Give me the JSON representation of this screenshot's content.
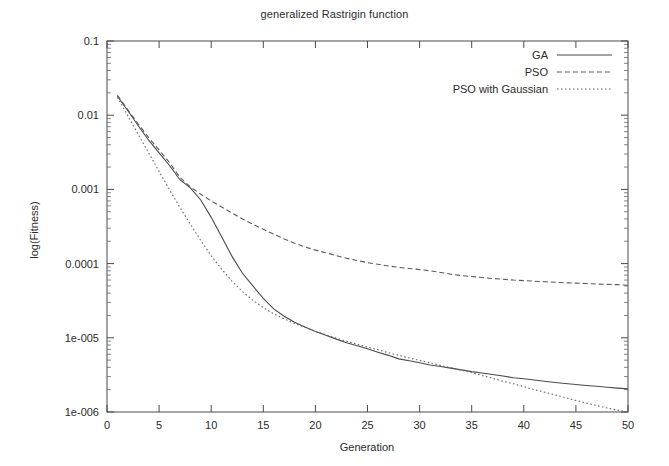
{
  "chart_data": {
    "type": "line",
    "title": "generalized Rastrigin function",
    "xlabel": "Generation",
    "ylabel": "log(Fitness)",
    "xlim": [
      0,
      50
    ],
    "ylim": [
      1e-06,
      0.1
    ],
    "yscale": "log",
    "grid": false,
    "legend_position": "top-right",
    "xticks": [
      0,
      5,
      10,
      15,
      20,
      25,
      30,
      35,
      40,
      45,
      50
    ],
    "xtick_labels": [
      "0",
      "5",
      "10",
      "15",
      "20",
      "25",
      "30",
      "35",
      "40",
      "45",
      "50"
    ],
    "yticks": [
      0.1,
      0.01,
      0.001,
      0.0001,
      1e-05,
      1e-06
    ],
    "ytick_labels": [
      "0.1",
      "0.01",
      "0.001",
      "0.0001",
      "1e-005",
      "1e-006"
    ],
    "x": [
      1,
      2,
      3,
      4,
      5,
      6,
      7,
      8,
      9,
      10,
      11,
      12,
      13,
      14,
      15,
      16,
      17,
      18,
      19,
      20,
      21,
      22,
      23,
      24,
      25,
      26,
      27,
      28,
      29,
      30,
      31,
      32,
      33,
      34,
      35,
      36,
      37,
      38,
      39,
      40,
      41,
      42,
      43,
      44,
      45,
      46,
      47,
      48,
      49,
      50
    ],
    "series": [
      {
        "name": "GA",
        "style": "solid",
        "values": [
          0.018,
          0.0115,
          0.0072,
          0.0046,
          0.0031,
          0.0021,
          0.00135,
          0.00105,
          0.00072,
          0.00042,
          0.00023,
          0.000125,
          7.4e-05,
          5e-05,
          3.4e-05,
          2.45e-05,
          1.95e-05,
          1.62e-05,
          1.4e-05,
          1.22e-05,
          1.08e-05,
          9.6e-06,
          8.6e-06,
          7.8e-06,
          7.1e-06,
          6.4e-06,
          5.8e-06,
          5.2e-06,
          4.9e-06,
          4.6e-06,
          4.3e-06,
          4.1e-06,
          3.9e-06,
          3.7e-06,
          3.5e-06,
          3.35e-06,
          3.2e-06,
          3.05e-06,
          2.9e-06,
          2.8e-06,
          2.7e-06,
          2.6e-06,
          2.5e-06,
          2.42e-06,
          2.35e-06,
          2.28e-06,
          2.22e-06,
          2.16e-06,
          2.1e-06,
          2.05e-06
        ]
      },
      {
        "name": "PSO",
        "style": "dashed",
        "values": [
          0.0185,
          0.0118,
          0.0076,
          0.005,
          0.0034,
          0.0023,
          0.00145,
          0.00108,
          0.00086,
          0.0007,
          0.00058,
          0.00048,
          0.0004,
          0.00034,
          0.00029,
          0.00025,
          0.000215,
          0.000188,
          0.000168,
          0.000152,
          0.00014,
          0.000128,
          0.000118,
          0.00011,
          0.000103,
          9.8e-05,
          9.3e-05,
          8.9e-05,
          8.6e-05,
          8.3e-05,
          8e-05,
          7.6e-05,
          7.2e-05,
          6.9e-05,
          6.7e-05,
          6.5e-05,
          6.3e-05,
          6.15e-05,
          6e-05,
          5.9e-05,
          5.8e-05,
          5.7e-05,
          5.6e-05,
          5.5e-05,
          5.45e-05,
          5.4e-05,
          5.3e-05,
          5.25e-05,
          5.2e-05,
          5.1e-05
        ]
      },
      {
        "name": "PSO with Gaussian",
        "style": "dotted",
        "values": [
          0.0175,
          0.0098,
          0.0055,
          0.0031,
          0.00175,
          0.00099,
          0.00057,
          0.00034,
          0.000205,
          0.000128,
          8.4e-05,
          5.8e-05,
          4.2e-05,
          3.2e-05,
          2.55e-05,
          2.1e-05,
          1.8e-05,
          1.56e-05,
          1.38e-05,
          1.23e-05,
          1.1e-05,
          9.9e-06,
          9e-06,
          8.2e-06,
          7.5e-06,
          6.9e-06,
          6.3e-06,
          5.8e-06,
          5.35e-06,
          4.95e-06,
          4.6e-06,
          4.25e-06,
          3.95e-06,
          3.65e-06,
          3.4e-06,
          3.1e-06,
          2.85e-06,
          2.6e-06,
          2.4e-06,
          2.2e-06,
          2e-06,
          1.85e-06,
          1.7e-06,
          1.56e-06,
          1.43e-06,
          1.32e-06,
          1.22e-06,
          1.13e-06,
          1.06e-06,
          1e-06
        ]
      }
    ]
  },
  "legend": {
    "entries": [
      {
        "label": "GA"
      },
      {
        "label": "PSO"
      },
      {
        "label": "PSO with Gaussian"
      }
    ]
  }
}
